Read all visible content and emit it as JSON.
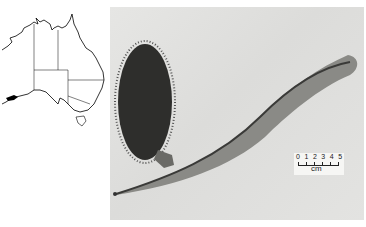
{
  "figure": {
    "map": {
      "subject": "Australia distribution map",
      "icon": "australia-map",
      "highlight_color": "#000000",
      "highlight_region": "south-west Western Australia"
    },
    "photo": {
      "subject": "Banksia specimen: flower spike and leaf",
      "background_color": "#e0e0de"
    },
    "scale_bar": {
      "numbers": "0 1 2 3 4 5",
      "unit": "cm"
    }
  }
}
